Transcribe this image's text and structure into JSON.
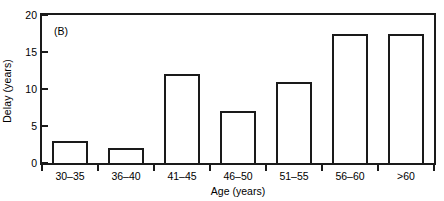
{
  "figure": {
    "panel_label": "(B)",
    "background_color": "#ffffff",
    "line_color": "#1a1a1a",
    "bar_fill_color": "#ffffff"
  },
  "chart_data": {
    "type": "bar",
    "title": "",
    "panel_label": "(B)",
    "xlabel": "Age (years)",
    "ylabel": "Delay (years)",
    "categories": [
      "30–35",
      "36–40",
      "41–45",
      "46–50",
      "51–55",
      "56–60",
      ">60"
    ],
    "values": [
      3,
      2,
      12,
      7,
      11,
      17.5,
      17.5
    ],
    "ylim": [
      0,
      20
    ],
    "yticks": [
      0,
      5,
      10,
      15,
      20
    ],
    "ytick_labels": [
      "0",
      "5",
      "10",
      "15",
      "20"
    ],
    "grid": false,
    "legend": false,
    "bar_style": "outlined-unfilled"
  }
}
